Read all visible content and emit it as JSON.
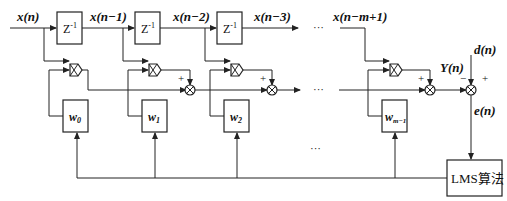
{
  "diagram": {
    "input_label": "x(n)",
    "delay_label": "Z",
    "delay_exp": "-1",
    "tap_labels": [
      "x(n−1)",
      "x(n−2)",
      "x(n−3)",
      "x(n−m+1)"
    ],
    "ellipsis": "···",
    "weights": [
      {
        "base": "w",
        "sub": "0"
      },
      {
        "base": "w",
        "sub": "1"
      },
      {
        "base": "w",
        "sub": "2"
      },
      {
        "base": "w",
        "sub": "m−1"
      }
    ],
    "plus": "+",
    "minus": "−",
    "output_label": "Y(n)",
    "desired_label": "d(n)",
    "error_label": "e(n)",
    "lms_label": "LMS算法"
  }
}
